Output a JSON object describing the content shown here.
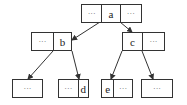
{
  "diagram": {
    "type": "tree",
    "nodes": [
      {
        "id": "a",
        "cells": [
          "···",
          "a",
          "···"
        ],
        "x": 81,
        "y": 4,
        "widths": [
          20,
          19,
          22
        ],
        "h": 19
      },
      {
        "id": "b",
        "cells": [
          "···",
          "b"
        ],
        "x": 31,
        "y": 32,
        "widths": [
          22,
          19
        ],
        "h": 19
      },
      {
        "id": "c",
        "cells": [
          "c",
          "···"
        ],
        "x": 122,
        "y": 32,
        "widths": [
          20,
          23
        ],
        "h": 19
      },
      {
        "id": "leaf1",
        "cells": [
          "···"
        ],
        "x": 12,
        "y": 79,
        "widths": [
          31
        ],
        "h": 19
      },
      {
        "id": "d",
        "cells": [
          "···",
          "d"
        ],
        "x": 58,
        "y": 79,
        "widths": [
          20,
          11
        ],
        "h": 19
      },
      {
        "id": "e",
        "cells": [
          "e",
          "···"
        ],
        "x": 101,
        "y": 79,
        "widths": [
          12,
          20
        ],
        "h": 19
      },
      {
        "id": "leaf4",
        "cells": [
          "···"
        ],
        "x": 141,
        "y": 79,
        "widths": [
          32
        ],
        "h": 19
      }
    ],
    "edges": [
      {
        "from": "a",
        "to": "b",
        "x1": 100,
        "y1": 22,
        "x2": 72,
        "y2": 40
      },
      {
        "from": "a",
        "to": "c",
        "x1": 120,
        "y1": 22,
        "x2": 132,
        "y2": 32
      },
      {
        "from": "b",
        "to": "leaf1",
        "x1": 53,
        "y1": 51,
        "x2": 28,
        "y2": 79
      },
      {
        "from": "b",
        "to": "d",
        "x1": 72,
        "y1": 51,
        "x2": 79,
        "y2": 79
      },
      {
        "from": "c",
        "to": "e",
        "x1": 122,
        "y1": 51,
        "x2": 111,
        "y2": 79
      },
      {
        "from": "c",
        "to": "leaf4",
        "x1": 142,
        "y1": 51,
        "x2": 153,
        "y2": 79
      }
    ],
    "colors": {
      "stroke": "#333333",
      "text": "#222222",
      "ellipsis": "#666666"
    }
  }
}
